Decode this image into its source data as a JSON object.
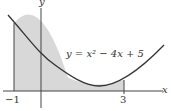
{
  "diagram": {
    "equation": "y = x² − 4x + 5",
    "axis_x_label": "x",
    "axis_y_label": "y",
    "tick_left": "−1",
    "tick_right": "3",
    "shade_interval": [
      -1,
      3
    ],
    "colors": {
      "curve": "#333333",
      "shade": "#d8d8d8",
      "axis": "#444444"
    }
  }
}
